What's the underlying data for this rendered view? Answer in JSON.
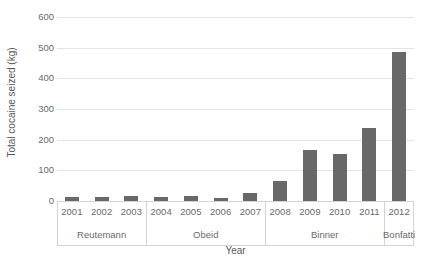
{
  "chart_data": {
    "type": "bar",
    "title": "",
    "xlabel": "Year",
    "ylabel": "Total cocaine seized (kg)",
    "categories": [
      "2001",
      "2002",
      "2003",
      "2004",
      "2005",
      "2006",
      "2007",
      "2008",
      "2009",
      "2010",
      "2011",
      "2012"
    ],
    "values": [
      14,
      14,
      15,
      12,
      17,
      9,
      26,
      66,
      167,
      154,
      239,
      485
    ],
    "ylim": [
      0,
      600
    ],
    "yticks": [
      0,
      100,
      200,
      300,
      400,
      500,
      600
    ],
    "ytick_labels": [
      "0",
      "100",
      "200",
      "300",
      "400",
      "500",
      "600"
    ],
    "grid": true,
    "legend": "none",
    "bar_color": "#686868",
    "gridline_color": "#e4e4e4",
    "axis_color": "#d4d4d4",
    "groups": [
      {
        "label": "Reutemann",
        "categories": [
          "2001",
          "2002",
          "2003"
        ]
      },
      {
        "label": "Obeid",
        "categories": [
          "2004",
          "2005",
          "2006",
          "2007"
        ]
      },
      {
        "label": "Binner",
        "categories": [
          "2008",
          "2009",
          "2010",
          "2011"
        ]
      },
      {
        "label": "Bonfatti",
        "categories": [
          "2012"
        ]
      }
    ]
  }
}
